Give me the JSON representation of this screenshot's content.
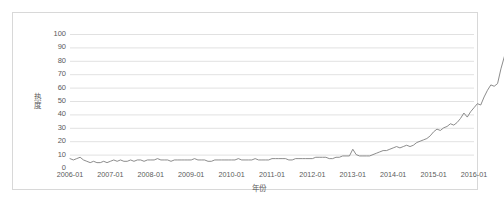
{
  "chart_data": {
    "type": "line",
    "title": "",
    "xlabel": "年份",
    "ylabel": "热度",
    "ylim": [
      0,
      100
    ],
    "yticks": [
      0,
      10,
      20,
      30,
      40,
      50,
      60,
      70,
      80,
      90,
      100
    ],
    "xticks": [
      "2006-01",
      "2007-01",
      "2008-01",
      "2009-01",
      "2010-01",
      "2011-01",
      "2012-01",
      "2013-01",
      "2014-01",
      "2015-01",
      "2016-01"
    ],
    "grid": true,
    "grid_axis": "y",
    "legend": false,
    "line_color": "#7f7f7f",
    "grid_color": "#d9d9d9",
    "border_color": "#d8d8d8",
    "series": [
      {
        "name": "热度",
        "x_start": "2006-01",
        "x_step": "month",
        "values": [
          7,
          6,
          7,
          8,
          6,
          5,
          4,
          5,
          4,
          4,
          5,
          4,
          5,
          6,
          5,
          6,
          5,
          5,
          6,
          5,
          6,
          6,
          5,
          6,
          6,
          6,
          7,
          6,
          6,
          6,
          5,
          6,
          6,
          6,
          6,
          6,
          6,
          7,
          6,
          6,
          6,
          5,
          5,
          6,
          6,
          6,
          6,
          6,
          6,
          6,
          7,
          6,
          6,
          6,
          6,
          7,
          6,
          6,
          6,
          6,
          7,
          7,
          7,
          7,
          7,
          6,
          6,
          7,
          7,
          7,
          7,
          7,
          7,
          8,
          8,
          8,
          8,
          7,
          7,
          8,
          8,
          9,
          9,
          9,
          14,
          10,
          9,
          9,
          9,
          9,
          10,
          11,
          12,
          13,
          13,
          14,
          15,
          16,
          15,
          16,
          17,
          16,
          17,
          19,
          20,
          21,
          22,
          24,
          27,
          29,
          28,
          30,
          31,
          33,
          32,
          34,
          37,
          41,
          38,
          42,
          45,
          48,
          47,
          53,
          58,
          62,
          61,
          63,
          74,
          83,
          92,
          100
        ]
      }
    ]
  }
}
